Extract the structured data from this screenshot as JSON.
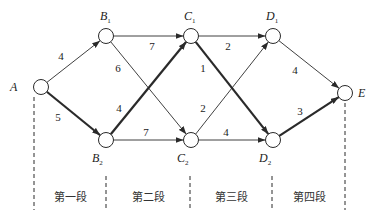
{
  "diagram": {
    "nodes": [
      {
        "id": "A",
        "label": "A",
        "sub": "",
        "x": 41,
        "y": 87,
        "lx": 10,
        "ly": 91
      },
      {
        "id": "B1",
        "label": "B",
        "sub": "1",
        "x": 106,
        "y": 36,
        "lx": 100,
        "ly": 20
      },
      {
        "id": "B2",
        "label": "B",
        "sub": "2",
        "x": 106,
        "y": 140,
        "lx": 92,
        "ly": 162
      },
      {
        "id": "C1",
        "label": "C",
        "sub": "1",
        "x": 191,
        "y": 36,
        "lx": 184,
        "ly": 20
      },
      {
        "id": "C2",
        "label": "C",
        "sub": "2",
        "x": 191,
        "y": 140,
        "lx": 177,
        "ly": 162
      },
      {
        "id": "D1",
        "label": "D",
        "sub": "1",
        "x": 273,
        "y": 36,
        "lx": 266,
        "ly": 20
      },
      {
        "id": "D2",
        "label": "D",
        "sub": "2",
        "x": 273,
        "y": 140,
        "lx": 259,
        "ly": 162
      },
      {
        "id": "E",
        "label": "E",
        "sub": "",
        "x": 345,
        "y": 93,
        "lx": 358,
        "ly": 97
      }
    ],
    "edges": [
      {
        "from": "A",
        "to": "B1",
        "weight": "4",
        "bold": false,
        "wx": 61,
        "wy": 60
      },
      {
        "from": "A",
        "to": "B2",
        "weight": "5",
        "bold": true,
        "wx": 58,
        "wy": 121
      },
      {
        "from": "B1",
        "to": "C1",
        "weight": "7",
        "bold": false,
        "wx": 152,
        "wy": 50
      },
      {
        "from": "B1",
        "to": "C2",
        "weight": "6",
        "bold": false,
        "wx": 118,
        "wy": 72
      },
      {
        "from": "B2",
        "to": "C1",
        "weight": "4",
        "bold": true,
        "wx": 119,
        "wy": 112
      },
      {
        "from": "B2",
        "to": "C2",
        "weight": "7",
        "bold": false,
        "wx": 146,
        "wy": 136
      },
      {
        "from": "C1",
        "to": "D1",
        "weight": "2",
        "bold": false,
        "wx": 228,
        "wy": 50
      },
      {
        "from": "C1",
        "to": "D2",
        "weight": "1",
        "bold": true,
        "wx": 203,
        "wy": 72
      },
      {
        "from": "C2",
        "to": "D1",
        "weight": "2",
        "bold": false,
        "wx": 203,
        "wy": 112
      },
      {
        "from": "C2",
        "to": "D2",
        "weight": "4",
        "bold": false,
        "wx": 226,
        "wy": 136
      },
      {
        "from": "D1",
        "to": "E",
        "weight": "4",
        "bold": false,
        "wx": 295,
        "wy": 74
      },
      {
        "from": "D2",
        "to": "E",
        "weight": "3",
        "bold": true,
        "wx": 300,
        "wy": 115
      }
    ],
    "dividers": [
      {
        "x": 34,
        "y1": 97,
        "y2": 210
      },
      {
        "x": 106,
        "y1": 176,
        "y2": 210
      },
      {
        "x": 190,
        "y1": 176,
        "y2": 210
      },
      {
        "x": 272,
        "y1": 176,
        "y2": 210
      },
      {
        "x": 345,
        "y1": 103,
        "y2": 210
      }
    ],
    "stages": [
      {
        "label": "第一段",
        "x": 70,
        "y": 201
      },
      {
        "label": "第二段",
        "x": 148,
        "y": 201
      },
      {
        "label": "第三段",
        "x": 231,
        "y": 201
      },
      {
        "label": "第四段",
        "x": 309,
        "y": 201
      }
    ],
    "node_radius": 7.5,
    "colors": {
      "line": "#2a2a2a",
      "node_fill": "#ffffff",
      "background": "#ffffff"
    }
  }
}
